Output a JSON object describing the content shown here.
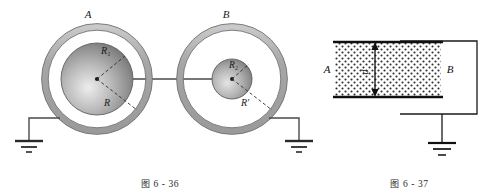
{
  "page": {
    "background": "#ffffff",
    "ink": "#1a1a1a",
    "width": 499,
    "height": 194
  },
  "figures": [
    {
      "id": "fig-6-36",
      "caption_cn": "图",
      "caption_num": "6 - 36",
      "caption_full": "图 6 - 36",
      "type": "two-concentric-spherical-capacitors",
      "colors": {
        "shell_fill": "#b0b0b0",
        "shell_stroke": "#6e6e6e",
        "inner_sphere_light": "#e8e8e8",
        "inner_sphere_dark": "#6f6f6f",
        "wire": "#4a4a4a",
        "dash": "#333333"
      },
      "spheres": [
        {
          "name": "A",
          "top_label": "A",
          "inner_radius_label": "R₁",
          "outer_radius_label": "R",
          "inner_sphere_relative_size": "large",
          "grounded": true,
          "ground_side": "left"
        },
        {
          "name": "B",
          "top_label": "B",
          "inner_radius_label": "R₂",
          "outer_radius_label": "R′",
          "inner_sphere_relative_size": "small",
          "grounded": true,
          "ground_side": "right"
        }
      ],
      "connection": {
        "kind": "conducting-wire",
        "between": [
          "A-inner-sphere",
          "B-inner-sphere"
        ],
        "orientation": "horizontal"
      },
      "ground_symbol": {
        "kind": "earth-ground",
        "bars": 3,
        "count": 2
      }
    },
    {
      "id": "fig-6-37",
      "caption_cn": "图",
      "caption_num": "6 - 37",
      "caption_full": "图 6 - 37",
      "type": "parallel-plate-capacitor-with-dielectric",
      "colors": {
        "plate": "#1a1a1a",
        "dielectric_dots": "#2a2a2a",
        "dielectric_bg": "#ffffff",
        "wire": "#1a1a1a"
      },
      "plates": [
        {
          "name": "A",
          "label": "A",
          "position": "left"
        },
        {
          "name": "B",
          "label": "B",
          "position": "right"
        }
      ],
      "dimension": {
        "label": "d",
        "orientation": "vertical",
        "rotated": true,
        "arrow_heads": "both",
        "measures": "plate-separation"
      },
      "dielectric": {
        "fill_pattern": "stipple-dots",
        "between": [
          "plate-A",
          "plate-B"
        ]
      },
      "circuit": {
        "loop": "external-wire-right-side",
        "ground_symbol": {
          "kind": "earth-ground",
          "bars": 3,
          "count": 1
        }
      }
    }
  ]
}
